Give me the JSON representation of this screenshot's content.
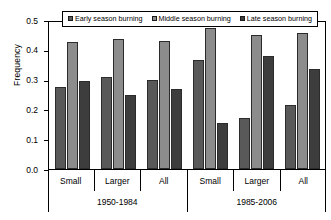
{
  "chart_data": {
    "type": "bar",
    "title": "",
    "xlabel": "",
    "ylabel": "Frequency",
    "ylim": [
      0.0,
      0.5
    ],
    "yticks": [
      0.0,
      0.1,
      0.2,
      0.3,
      0.4,
      0.5
    ],
    "ytick_labels": [
      "0.0",
      "0.1",
      "0.2",
      "0.3",
      "0.4",
      "0.5"
    ],
    "grid": false,
    "legend_position": "top-center-inside",
    "categories": [
      "Small",
      "Larger",
      "All",
      "Small",
      "Larger",
      "All"
    ],
    "group_labels": [
      "1950-1984",
      "1985-2006"
    ],
    "series": [
      {
        "name": "Early season burning",
        "color": "#595959",
        "values": [
          0.275,
          0.31,
          0.3,
          0.365,
          0.17,
          0.215
        ]
      },
      {
        "name": "Middle season burning",
        "color": "#8c8c8c",
        "values": [
          0.425,
          0.435,
          0.43,
          0.475,
          0.45,
          0.455
        ]
      },
      {
        "name": "Late season burning",
        "color": "#3d3d3d",
        "values": [
          0.295,
          0.25,
          0.27,
          0.155,
          0.38,
          0.335
        ]
      }
    ]
  },
  "axis": {
    "y_title": "Frequency"
  },
  "legend": {
    "items": [
      {
        "label": "Early season burning",
        "swatch": "series-0"
      },
      {
        "label": "Middle season burning",
        "swatch": "series-1"
      },
      {
        "label": "Late season burning",
        "swatch": "series-2"
      }
    ]
  }
}
